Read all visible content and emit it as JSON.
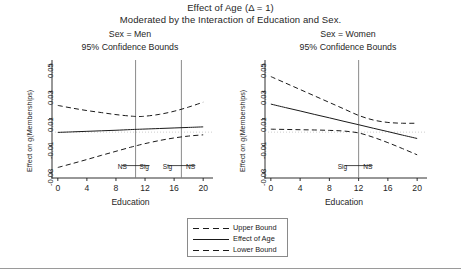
{
  "title": {
    "line1": "Effect of Age (Δ = 1)",
    "line2": "Moderated by  the Interaction of Education  and Sex."
  },
  "legend": {
    "items": [
      {
        "label": "Upper Bound",
        "style": "dashed"
      },
      {
        "label": "Effect of Age",
        "style": "solid"
      },
      {
        "label": "Lower Bound",
        "style": "dashed"
      }
    ]
  },
  "footer_rule": true,
  "chart_data": {
    "type": "line",
    "title": "Effect of Age (Δ = 1)",
    "subtitle": "Moderated by  the Interaction of Education  and Sex.",
    "xlabel": "Education",
    "ylabel": "Effect on g(Memberships)",
    "xlim": [
      -0.8,
      20.8
    ],
    "ylim": [
      -0.034,
      0.052
    ],
    "xticks": [
      0,
      4,
      8,
      12,
      16,
      20
    ],
    "xticklabels": [
      "0",
      "4",
      "8",
      "12",
      "16",
      "20"
    ],
    "yticks": [
      -0.03,
      -0.01,
      0.01,
      0.03,
      0.05
    ],
    "yticklabels": [
      "-0.03",
      "-0.01",
      "0.01",
      "0.03",
      "0.05"
    ],
    "grid": false,
    "zero_reference_line": 0.0,
    "legend_position": "bottom-center",
    "panels": [
      {
        "name": "men",
        "title": "Sex = Men",
        "subtitle": "95% Confidence Bounds",
        "x": [
          0,
          2,
          4,
          6,
          8,
          10,
          11,
          12,
          14,
          16,
          18,
          20
        ],
        "series": [
          {
            "name": "Upper Bound",
            "style": "dashed",
            "values": [
              0.0198,
              0.0178,
              0.016,
              0.0145,
              0.013,
              0.0119,
              0.0116,
              0.0118,
              0.0132,
              0.0155,
              0.0186,
              0.0222
            ]
          },
          {
            "name": "Effect of Age",
            "style": "solid",
            "values": [
              -0.0002,
              0.0002,
              0.0006,
              0.001,
              0.0014,
              0.0019,
              0.0021,
              0.0023,
              0.0027,
              0.0031,
              0.0035,
              0.0039
            ]
          },
          {
            "name": "Lower Bound",
            "style": "dashed",
            "values": [
              -0.0262,
              -0.0233,
              -0.0203,
              -0.0172,
              -0.0142,
              -0.0112,
              -0.0098,
              -0.0085,
              -0.0062,
              -0.0043,
              -0.0029,
              -0.002
            ]
          }
        ],
        "vlines": [
          10.7,
          17.0
        ],
        "annotations": [
          {
            "text": "NS",
            "x": 9.2,
            "y": -0.0255
          },
          {
            "text": "Sig",
            "x": 12.2,
            "y": -0.0255
          },
          {
            "text": "Sig",
            "x": 15.4,
            "y": -0.0255
          },
          {
            "text": "NS",
            "x": 18.6,
            "y": -0.0255
          }
        ]
      },
      {
        "name": "women",
        "title": "Sex = Women",
        "subtitle": "95% Confidence Bounds",
        "x": [
          0,
          2,
          4,
          6,
          8,
          10,
          12,
          14,
          16,
          18,
          20
        ],
        "series": [
          {
            "name": "Upper Bound",
            "style": "dashed",
            "values": [
              0.0412,
              0.0364,
              0.0316,
              0.0268,
              0.022,
              0.0172,
              0.0124,
              0.009,
              0.0072,
              0.0066,
              0.0066
            ]
          },
          {
            "name": "Effect of Age",
            "style": "solid",
            "values": [
              0.0208,
              0.0182,
              0.0157,
              0.0131,
              0.0106,
              0.008,
              0.0055,
              0.0029,
              0.0004,
              -0.0022,
              -0.0047
            ]
          },
          {
            "name": "Lower Bound",
            "style": "dashed",
            "values": [
              0.0022,
              0.002,
              0.0018,
              0.0016,
              0.0013,
              0.0008,
              -0.0006,
              -0.0038,
              -0.0078,
              -0.0122,
              -0.0168
            ]
          }
        ],
        "vlines": [
          12.0
        ],
        "annotations": [
          {
            "text": "Sig",
            "x": 10.1,
            "y": -0.0255
          },
          {
            "text": "NS",
            "x": 13.6,
            "y": -0.0255
          }
        ]
      }
    ]
  }
}
